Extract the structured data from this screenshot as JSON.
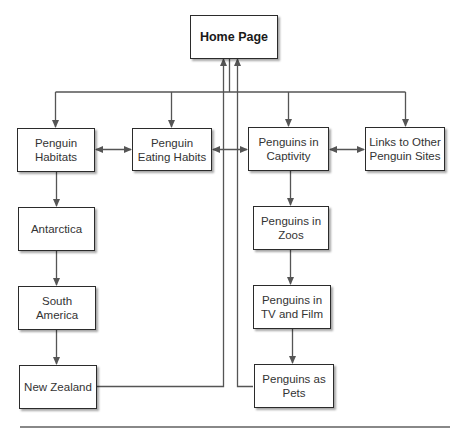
{
  "diagram": {
    "nodes": {
      "home": "Home Page",
      "habitats": "Penguin Habitats",
      "eating": "Penguin Eating Habits",
      "captivity": "Penguins in Captivity",
      "links": "Links to Other Penguin Sites",
      "antarctica": "Antarctica",
      "south_america": "South America",
      "new_zealand": "New Zealand",
      "zoos": "Penguins in Zoos",
      "tv_film": "Penguins in TV and Film",
      "pets": "Penguins as Pets"
    },
    "edges": [
      {
        "from": "home",
        "to": "habitats",
        "type": "arrow"
      },
      {
        "from": "home",
        "to": "eating",
        "type": "arrow"
      },
      {
        "from": "home",
        "to": "captivity",
        "type": "arrow"
      },
      {
        "from": "home",
        "to": "links",
        "type": "arrow"
      },
      {
        "from": "habitats",
        "to": "eating",
        "type": "bidirectional"
      },
      {
        "from": "eating",
        "to": "captivity",
        "type": "bidirectional"
      },
      {
        "from": "captivity",
        "to": "links",
        "type": "bidirectional"
      },
      {
        "from": "habitats",
        "to": "antarctica",
        "type": "arrow"
      },
      {
        "from": "antarctica",
        "to": "south_america",
        "type": "arrow"
      },
      {
        "from": "south_america",
        "to": "new_zealand",
        "type": "arrow"
      },
      {
        "from": "new_zealand",
        "to": "home",
        "type": "arrow"
      },
      {
        "from": "captivity",
        "to": "zoos",
        "type": "arrow"
      },
      {
        "from": "zoos",
        "to": "tv_film",
        "type": "arrow"
      },
      {
        "from": "tv_film",
        "to": "pets",
        "type": "arrow"
      },
      {
        "from": "pets",
        "to": "home",
        "type": "arrow"
      }
    ],
    "colors": {
      "line": "#555555",
      "border": "#2b2b2b",
      "text": "#333333"
    }
  }
}
